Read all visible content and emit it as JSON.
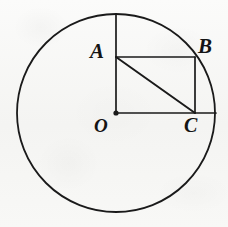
{
  "figure": {
    "kind": "geometry-diagram",
    "canvas": {
      "width": 228,
      "height": 227
    },
    "background_color": "#f7f7f5",
    "ink_color": "#1a1a1a"
  },
  "circle": {
    "name": "main-circle",
    "center_x": 116,
    "center_y": 113,
    "radius": 99,
    "stroke_width": 1.8,
    "fill": "none"
  },
  "points": [
    {
      "id": "O",
      "label": "O",
      "x": 116,
      "y": 113,
      "dot": true,
      "dot_radius": 2.6
    },
    {
      "id": "A",
      "label": "A",
      "x": 116,
      "y": 57,
      "dot": false
    },
    {
      "id": "B",
      "label": "B",
      "x": 195,
      "y": 57,
      "dot": false
    },
    {
      "id": "C",
      "label": "C",
      "x": 195,
      "y": 113,
      "dot": false
    }
  ],
  "segments": [
    {
      "id": "radius-vertical-OT",
      "from_x": 116,
      "from_y": 15,
      "to_x": 116,
      "to_y": 113,
      "stroke_width": 1.7
    },
    {
      "id": "side-AB",
      "from_x": 116,
      "from_y": 57,
      "to_x": 195,
      "to_y": 57,
      "stroke_width": 1.7
    },
    {
      "id": "side-BC",
      "from_x": 195,
      "from_y": 57,
      "to_x": 195,
      "to_y": 113,
      "stroke_width": 1.7
    },
    {
      "id": "radius-horizontal-OR",
      "from_x": 116,
      "from_y": 113,
      "to_x": 216,
      "to_y": 113,
      "stroke_width": 1.7
    },
    {
      "id": "diagonal-AC",
      "from_x": 116,
      "from_y": 57,
      "to_x": 195,
      "to_y": 113,
      "stroke_width": 2.0
    }
  ],
  "labels": {
    "A": "A",
    "B": "B",
    "O": "O",
    "C": "C"
  }
}
